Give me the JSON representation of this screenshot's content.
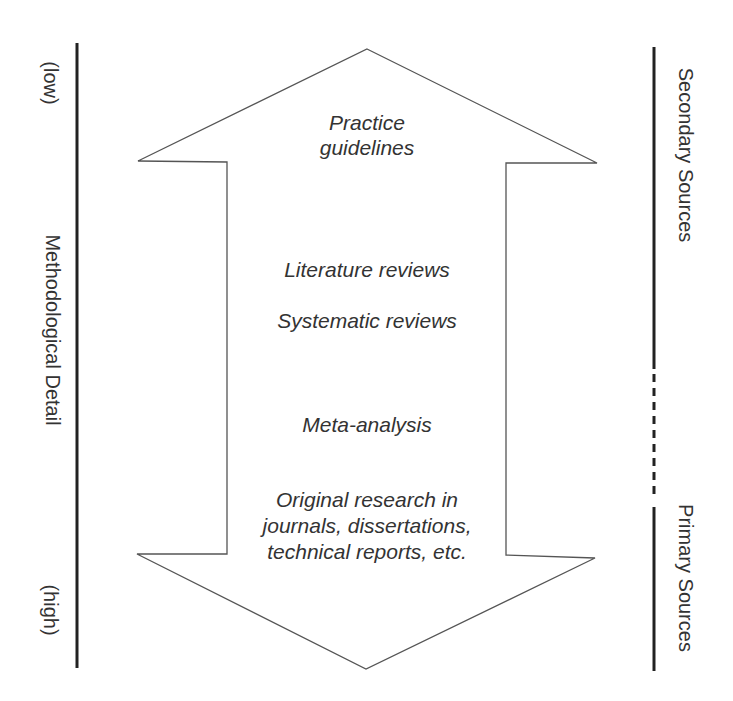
{
  "diagram": {
    "type": "double-headed-arrow-hierarchy",
    "left_axis": {
      "title": "Methodological Detail",
      "top_label": "(low)",
      "bottom_label": "(high)"
    },
    "right_axis": {
      "top_label": "Secondary Sources",
      "bottom_label": "Primary Sources",
      "segments": [
        "solid",
        "dashed",
        "solid"
      ]
    },
    "arrow_items": [
      {
        "id": "practice-guidelines",
        "lines": [
          "Practice",
          "guidelines"
        ]
      },
      {
        "id": "literature-reviews",
        "lines": [
          "Literature reviews"
        ]
      },
      {
        "id": "systematic-reviews",
        "lines": [
          "Systematic reviews"
        ]
      },
      {
        "id": "meta-analysis",
        "lines": [
          "Meta-analysis"
        ]
      },
      {
        "id": "original-research",
        "lines": [
          "Original research in",
          "journals, dissertations,",
          "technical reports, etc."
        ]
      }
    ],
    "colors": {
      "line": "#222222",
      "arrow_outline": "#555555",
      "text": "#333333",
      "background": "#ffffff"
    }
  }
}
